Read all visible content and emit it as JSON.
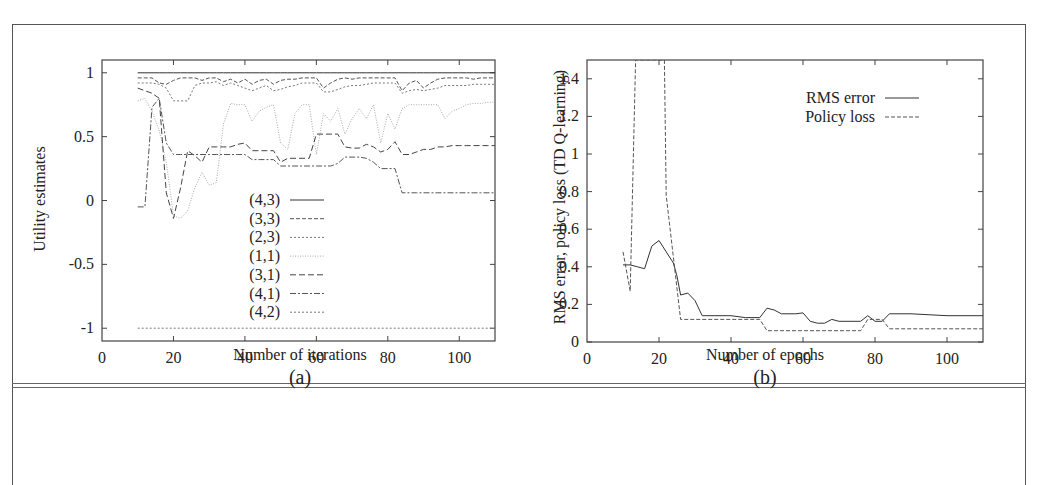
{
  "figure": {
    "panels": [
      {
        "caption": "(a)",
        "xlabel": "Number of iterations",
        "ylabel": "Utility estimates"
      },
      {
        "caption": "(b)",
        "xlabel": "Number of epochs",
        "ylabel": "RMS error, policy loss (TD Q-learning)"
      }
    ]
  },
  "chart_data": [
    {
      "type": "line",
      "title": "",
      "caption": "(a)",
      "xlabel": "Number of iterations",
      "ylabel": "Utility estimates",
      "xlim": [
        0,
        110
      ],
      "ylim": [
        -1.1,
        1.1
      ],
      "xticks": [
        0,
        20,
        40,
        60,
        80,
        100
      ],
      "yticks": [
        -1,
        -0.5,
        0,
        0.5,
        1
      ],
      "xtick_labels": [
        "0",
        "20",
        "40",
        "60",
        "80",
        "100"
      ],
      "ytick_labels": [
        "-1",
        "-0.5",
        "0",
        "0.5",
        "1"
      ],
      "grid": false,
      "legend_position": "center-inside",
      "x": [
        10,
        12,
        14,
        16,
        18,
        20,
        22,
        24,
        26,
        28,
        30,
        32,
        34,
        36,
        38,
        40,
        42,
        44,
        46,
        48,
        50,
        52,
        54,
        56,
        58,
        60,
        62,
        64,
        66,
        68,
        70,
        72,
        74,
        76,
        78,
        80,
        82,
        84,
        86,
        88,
        90,
        92,
        94,
        96,
        98,
        100,
        102,
        104,
        106,
        108,
        110
      ],
      "series": [
        {
          "name": "(4,3)",
          "style": "solid",
          "values": [
            1,
            1,
            1,
            1,
            1,
            1,
            1,
            1,
            1,
            1,
            1,
            1,
            1,
            1,
            1,
            1,
            1,
            1,
            1,
            1,
            1,
            1,
            1,
            1,
            1,
            1,
            1,
            1,
            1,
            1,
            1,
            1,
            1,
            1,
            1,
            1,
            1,
            1,
            1,
            1,
            1,
            1,
            1,
            1,
            1,
            1,
            1,
            1,
            1,
            1,
            1
          ]
        },
        {
          "name": "(3,3)",
          "style": "dashed",
          "values": [
            0.96,
            0.96,
            0.96,
            0.92,
            0.91,
            0.94,
            0.96,
            0.96,
            0.96,
            0.94,
            0.96,
            0.96,
            0.93,
            0.95,
            0.92,
            0.95,
            0.91,
            0.94,
            0.95,
            0.91,
            0.94,
            0.95,
            0.95,
            0.96,
            0.96,
            0.96,
            0.88,
            0.92,
            0.95,
            0.96,
            0.95,
            0.96,
            0.96,
            0.96,
            0.96,
            0.96,
            0.96,
            0.86,
            0.92,
            0.94,
            0.88,
            0.92,
            0.95,
            0.96,
            0.96,
            0.96,
            0.96,
            0.95,
            0.96,
            0.96,
            0.96
          ]
        },
        {
          "name": "(2,3)",
          "style": "dotted",
          "values": [
            0.92,
            0.92,
            0.92,
            0.91,
            0.88,
            0.78,
            0.78,
            0.78,
            0.9,
            0.92,
            0.92,
            0.93,
            0.9,
            0.92,
            0.9,
            0.88,
            0.86,
            0.88,
            0.9,
            0.86,
            0.87,
            0.89,
            0.9,
            0.92,
            0.92,
            0.92,
            0.85,
            0.85,
            0.87,
            0.89,
            0.9,
            0.9,
            0.91,
            0.92,
            0.92,
            0.92,
            0.92,
            0.84,
            0.86,
            0.87,
            0.86,
            0.87,
            0.88,
            0.9,
            0.9,
            0.9,
            0.9,
            0.91,
            0.91,
            0.91,
            0.91
          ]
        },
        {
          "name": "(1,1)",
          "style": "dotted-fine",
          "values": [
            0.78,
            0.8,
            0.7,
            0.55,
            0.3,
            -0.12,
            -0.14,
            -0.08,
            0.1,
            0.22,
            0.12,
            0.14,
            0.6,
            0.76,
            0.75,
            0.75,
            0.62,
            0.7,
            0.73,
            0.75,
            0.45,
            0.4,
            0.68,
            0.75,
            0.75,
            0.36,
            0.68,
            0.62,
            0.72,
            0.52,
            0.64,
            0.72,
            0.64,
            0.75,
            0.45,
            0.68,
            0.56,
            0.72,
            0.75,
            0.75,
            0.75,
            0.75,
            0.75,
            0.64,
            0.7,
            0.72,
            0.75,
            0.76,
            0.76,
            0.77,
            0.77
          ]
        },
        {
          "name": "(3,1)",
          "style": "long-dash",
          "values": [
            0.88,
            0.86,
            0.84,
            0.8,
            0.06,
            -0.14,
            0.1,
            0.39,
            0.35,
            0.3,
            0.42,
            0.42,
            0.42,
            0.42,
            0.44,
            0.45,
            0.39,
            0.39,
            0.39,
            0.39,
            0.3,
            0.33,
            0.33,
            0.33,
            0.33,
            0.52,
            0.52,
            0.52,
            0.52,
            0.42,
            0.41,
            0.41,
            0.44,
            0.42,
            0.38,
            0.4,
            0.46,
            0.36,
            0.36,
            0.38,
            0.4,
            0.4,
            0.42,
            0.42,
            0.43,
            0.43,
            0.43,
            0.43,
            0.43,
            0.43,
            0.43
          ]
        },
        {
          "name": "(4,1)",
          "style": "dash-dot",
          "values": [
            -0.05,
            -0.05,
            0.73,
            0.8,
            0.45,
            0.36,
            0.36,
            0.36,
            0.36,
            0.36,
            0.36,
            0.36,
            0.36,
            0.36,
            0.36,
            0.36,
            0.32,
            0.32,
            0.32,
            0.32,
            0.27,
            0.27,
            0.27,
            0.27,
            0.27,
            0.27,
            0.27,
            0.27,
            0.29,
            0.34,
            0.34,
            0.34,
            0.33,
            0.3,
            0.25,
            0.25,
            0.25,
            0.06,
            0.06,
            0.06,
            0.06,
            0.06,
            0.06,
            0.06,
            0.06,
            0.06,
            0.06,
            0.06,
            0.06,
            0.06,
            0.06
          ]
        },
        {
          "name": "(4,2)",
          "style": "dotted",
          "values": [
            -1,
            -1,
            -1,
            -1,
            -1,
            -1,
            -1,
            -1,
            -1,
            -1,
            -1,
            -1,
            -1,
            -1,
            -1,
            -1,
            -1,
            -1,
            -1,
            -1,
            -1,
            -1,
            -1,
            -1,
            -1,
            -1,
            -1,
            -1,
            -1,
            -1,
            -1,
            -1,
            -1,
            -1,
            -1,
            -1,
            -1,
            -1,
            -1,
            -1,
            -1,
            -1,
            -1,
            -1,
            -1,
            -1,
            -1,
            -1,
            -1,
            -1,
            -1
          ]
        }
      ]
    },
    {
      "type": "line",
      "title": "",
      "caption": "(b)",
      "xlabel": "Number of epochs",
      "ylabel": "RMS error, policy loss (TD Q-learning)",
      "xlim": [
        0,
        110
      ],
      "ylim": [
        0,
        1.5
      ],
      "xticks": [
        0,
        20,
        40,
        60,
        80,
        100
      ],
      "yticks": [
        0,
        0.2,
        0.4,
        0.6,
        0.8,
        1,
        1.2,
        1.4
      ],
      "xtick_labels": [
        "0",
        "20",
        "40",
        "60",
        "80",
        "100"
      ],
      "ytick_labels": [
        "0",
        "0.2",
        "0.4",
        "0.6",
        "0.8",
        "1",
        "1.2",
        "1.4"
      ],
      "grid": false,
      "legend_position": "upper-right-inside",
      "series": [
        {
          "name": "RMS error",
          "style": "solid",
          "x": [
            10,
            12,
            14,
            16,
            18,
            20,
            22,
            24,
            25,
            26,
            28,
            30,
            32,
            40,
            44,
            48,
            50,
            52,
            54,
            58,
            60,
            62,
            64,
            66,
            68,
            70,
            76,
            78,
            80,
            82,
            84,
            90,
            100,
            110
          ],
          "values": [
            0.41,
            0.41,
            0.4,
            0.39,
            0.51,
            0.54,
            0.48,
            0.42,
            0.35,
            0.25,
            0.26,
            0.22,
            0.14,
            0.14,
            0.13,
            0.13,
            0.18,
            0.17,
            0.15,
            0.15,
            0.155,
            0.11,
            0.1,
            0.1,
            0.12,
            0.11,
            0.11,
            0.14,
            0.11,
            0.11,
            0.15,
            0.15,
            0.14,
            0.14
          ]
        },
        {
          "name": "Policy loss",
          "style": "dashed",
          "x": [
            10,
            12,
            13.5,
            21.5,
            22,
            26,
            48,
            50,
            76,
            78,
            82,
            84,
            110
          ],
          "values": [
            0.48,
            0.27,
            1.5,
            1.5,
            0.78,
            0.12,
            0.12,
            0.06,
            0.06,
            0.12,
            0.12,
            0.07,
            0.07
          ]
        }
      ]
    }
  ]
}
